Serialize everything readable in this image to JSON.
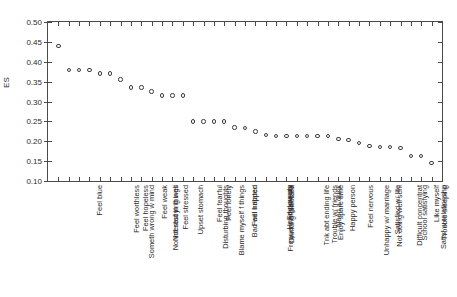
{
  "chart_data": {
    "type": "scatter",
    "title": "",
    "xlabel": "",
    "ylabel": "ES",
    "ylim": [
      0.1,
      0.5
    ],
    "ytick_labels": [
      "0.10",
      "0.15",
      "0.20",
      "0.25",
      "0.30",
      "0.35",
      "0.40",
      "0.45",
      "0.50"
    ],
    "ytick_values": [
      0.1,
      0.15,
      0.2,
      0.25,
      0.3,
      0.35,
      0.4,
      0.45,
      0.5
    ],
    "grid": false,
    "legend": null,
    "marker": "open-circle",
    "marker_color": "#3c3c3c",
    "categories": [
      "Feel blue",
      "Someth wrong w mind",
      "Feel worthless",
      "Feel hopeless",
      "No interest in things",
      "Not studying well",
      "Feel weak",
      "Feel stressed",
      "Upset stomach",
      "Disturbing thoughts",
      "Blame myself f things",
      "Feel fearful",
      "Feel lonely",
      "Bad will happen",
      "Feel irritated",
      "Frequent arguments",
      "Drinking criticized",
      "Heart pounds",
      "Feel angry",
      "Tnk abt ending life",
      "Trouble w/ friends",
      "Enjoy spare time",
      "Need a drink",
      "Happy person",
      "Unhappy w/ marriage",
      "Feel nervous",
      "Not doing well schl",
      "Satisfied w/ life",
      "Difficult concentrat",
      "School satisfying",
      "Satisf w relationshp",
      "Trouble sleeping",
      "Like myself",
      "Drinking trouble",
      "Family troubles",
      "Many disagreements",
      "Headaches"
    ],
    "values": [
      0.44,
      0.38,
      0.38,
      0.38,
      0.37,
      0.37,
      0.355,
      0.335,
      0.335,
      0.325,
      0.315,
      0.315,
      0.315,
      0.25,
      0.25,
      0.25,
      0.25,
      0.235,
      0.233,
      0.225,
      0.215,
      0.213,
      0.213,
      0.213,
      0.213,
      0.213,
      0.213,
      0.205,
      0.203,
      0.195,
      0.188,
      0.185,
      0.185,
      0.183,
      0.163,
      0.163,
      0.145
    ]
  }
}
